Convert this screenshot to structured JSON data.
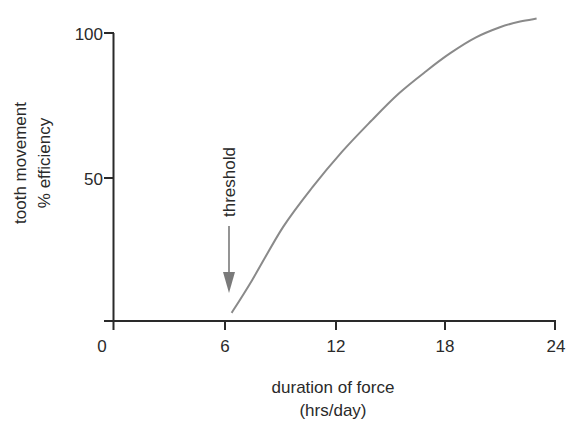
{
  "chart_data": {
    "type": "line",
    "title": "",
    "xlabel": [
      "duration of force",
      "(hrs/day)"
    ],
    "ylabel": [
      "tooth movement",
      "% efficiency"
    ],
    "xlim": [
      0,
      24
    ],
    "ylim": [
      0,
      100
    ],
    "x_ticks": [
      0,
      6,
      12,
      18,
      24
    ],
    "y_ticks": [
      50,
      100
    ],
    "grid": false,
    "legend": null,
    "series": [
      {
        "name": "efficiency",
        "color": "#8a8a8a",
        "x": [
          6.4,
          7.5,
          9.2,
          10.8,
          12.4,
          14.0,
          15.5,
          17.0,
          18.3,
          19.7,
          21.0,
          22.1,
          23.0
        ],
        "y": [
          2.8,
          14,
          32.6,
          46.5,
          58.7,
          69.5,
          79,
          86.8,
          93,
          98.5,
          102,
          104,
          105
        ]
      }
    ],
    "annotations": [
      {
        "text": "threshold",
        "x": 6.2,
        "arrow_tip_y": 10,
        "orientation": "vertical"
      }
    ]
  },
  "axes": {
    "x_tick_labels": [
      "0",
      "6",
      "12",
      "18",
      "24"
    ],
    "y_tick_labels": [
      "50",
      "100"
    ],
    "x_title_line1": "duration of force",
    "x_title_line2": "(hrs/day)",
    "y_title_line1": "tooth movement",
    "y_title_line2": "% efficiency"
  },
  "annotation": {
    "label": "threshold"
  },
  "colors": {
    "axis": "#2a2a2a",
    "curve": "#8a8a8a",
    "arrow": "#7a7a7a"
  }
}
